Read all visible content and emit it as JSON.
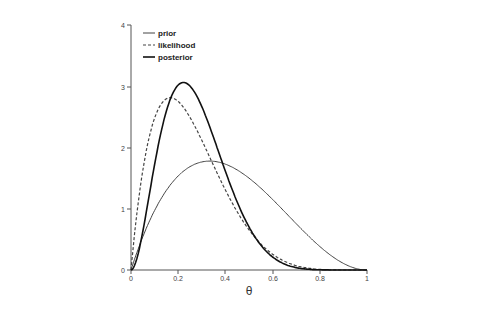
{
  "chart_data": {
    "type": "line",
    "title": "",
    "xlabel": "θ",
    "ylabel": "",
    "xlim": [
      0,
      1
    ],
    "ylim": [
      0,
      4
    ],
    "x_ticks": [
      "0",
      "0.2",
      "0.4",
      "0.6",
      "0.8",
      "1"
    ],
    "y_ticks": [
      "0",
      "1",
      "2",
      "3",
      "4"
    ],
    "grid": false,
    "legend_position": "top-left",
    "series": [
      {
        "name": "prior",
        "style": "solid-thin",
        "distribution": "Beta(2,3)",
        "peak": {
          "x": 0.333,
          "y": 1.78
        }
      },
      {
        "name": "likelihood",
        "style": "dashed",
        "distribution": "Beta(2,6) (normalized)",
        "peak": {
          "x": 0.167,
          "y": 2.81
        }
      },
      {
        "name": "posterior",
        "style": "solid-thick",
        "distribution": "Beta(3,8)",
        "peak": {
          "x": 0.222,
          "y": 3.07
        }
      }
    ]
  },
  "legend": {
    "prior": "prior",
    "likelihood": "likelihood",
    "posterior": "posterior"
  },
  "axis": {
    "xlabel": "θ",
    "x0": "0",
    "x1": "0.2",
    "x2": "0.4",
    "x3": "0.6",
    "x4": "0.8",
    "x5": "1",
    "y0": "0",
    "y1": "1",
    "y2": "2",
    "y3": "3",
    "y4": "4"
  }
}
